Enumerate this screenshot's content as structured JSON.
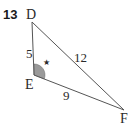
{
  "problem": {
    "number": "13"
  },
  "triangle": {
    "vertices": {
      "D": {
        "label": "D",
        "x": 32,
        "y": 22
      },
      "E": {
        "label": "E",
        "x": 34,
        "y": 75
      },
      "F": {
        "label": "F",
        "x": 124,
        "y": 110
      }
    },
    "sides": {
      "DE": {
        "label": "5"
      },
      "DF": {
        "label": "12"
      },
      "EF": {
        "label": "9"
      }
    },
    "marked_angle": {
      "vertex": "E",
      "marker": "★",
      "marker_label": "*",
      "fill_color": "#9a9a9a"
    },
    "stroke_color": "#555555"
  }
}
